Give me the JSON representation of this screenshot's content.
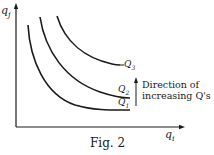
{
  "figure": {
    "caption": "Fig. 2",
    "axes": {
      "y_label": "q",
      "y_sub": "j",
      "x_label": "q",
      "x_sub": "i"
    },
    "curves": [
      {
        "id": "Q1",
        "label": "Q",
        "sub": "1"
      },
      {
        "id": "Q2",
        "label": "Q",
        "sub": "2"
      },
      {
        "id": "Q3",
        "label": "Q",
        "sub": "3"
      }
    ],
    "annotation": {
      "line1": "Direction of",
      "line2": "increasing Q's"
    },
    "colors": {
      "ink": "#1a1a1a",
      "background": "#ffffff"
    }
  }
}
